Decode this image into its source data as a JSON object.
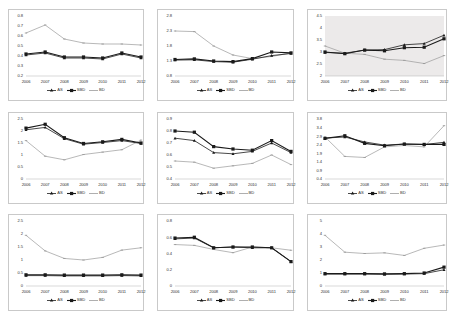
{
  "figure": {
    "layout": "3x3 grid of line charts",
    "panel_count": 9
  },
  "series_names": [
    "AS",
    "SBD",
    "BD"
  ],
  "legend": {
    "as": "AS",
    "sbd": "SBD",
    "bd": "BD",
    "position": "bottom-center"
  },
  "categories": [
    "2006",
    "2007",
    "2008",
    "2009",
    "2010",
    "2011",
    "2012"
  ],
  "colors": {
    "line_as": "#1a1a1a",
    "line_sbd": "#1a1a1a",
    "line_bd": "#9a9a9a",
    "axis": "#b0b0b0",
    "text": "#333333",
    "panel_border": "#c9c9c9",
    "shaded_plot_bg": "#eceaea"
  },
  "chart_data": [
    {
      "id": "panel-1",
      "type": "line",
      "title": "",
      "xlabel": "",
      "ylabel": "",
      "categories": [
        "2006",
        "2007",
        "2008",
        "2009",
        "2010",
        "2011",
        "2012"
      ],
      "yticks": [
        "0.8",
        "0.7",
        "0.6",
        "0.5",
        "0.4",
        "0.3",
        "0.2"
      ],
      "ylim": [
        0.2,
        0.8
      ],
      "grid": false,
      "series": [
        {
          "name": "AS",
          "values": [
            0.41,
            0.43,
            0.38,
            0.38,
            0.37,
            0.42,
            0.38
          ]
        },
        {
          "name": "SBD",
          "values": [
            0.42,
            0.44,
            0.39,
            0.39,
            0.38,
            0.43,
            0.39
          ]
        },
        {
          "name": "BD",
          "values": [
            0.63,
            0.71,
            0.57,
            0.53,
            0.52,
            0.52,
            0.51
          ]
        }
      ]
    },
    {
      "id": "panel-2",
      "type": "line",
      "title": "",
      "xlabel": "",
      "ylabel": "",
      "categories": [
        "2006",
        "2007",
        "2008",
        "2009",
        "2010",
        "2011",
        "2012"
      ],
      "yticks": [
        "2.8",
        "2.3",
        "1.8",
        "1.3",
        "0.8"
      ],
      "ylim": [
        0.8,
        2.8
      ],
      "grid": false,
      "series": [
        {
          "name": "AS",
          "values": [
            1.33,
            1.34,
            1.28,
            1.26,
            1.36,
            1.48,
            1.55
          ]
        },
        {
          "name": "SBD",
          "values": [
            1.35,
            1.37,
            1.3,
            1.28,
            1.38,
            1.6,
            1.57
          ]
        },
        {
          "name": "BD",
          "values": [
            2.3,
            2.28,
            1.8,
            1.5,
            1.38,
            1.45,
            1.57
          ]
        }
      ]
    },
    {
      "id": "panel-3",
      "type": "line",
      "title": "",
      "xlabel": "",
      "ylabel": "",
      "categories": [
        "2006",
        "2007",
        "2008",
        "2009",
        "2010",
        "2011",
        "2012"
      ],
      "yticks": [
        "4.5",
        "4",
        "3.5",
        "3",
        "2.5",
        "2"
      ],
      "ylim": [
        2.0,
        4.5
      ],
      "grid": false,
      "shaded": true,
      "series": [
        {
          "name": "AS",
          "values": [
            2.98,
            2.95,
            3.08,
            3.1,
            3.3,
            3.35,
            3.7
          ]
        },
        {
          "name": "SBD",
          "values": [
            3.0,
            2.93,
            3.08,
            3.05,
            3.18,
            3.2,
            3.55
          ]
        },
        {
          "name": "BD",
          "values": [
            3.25,
            2.95,
            2.9,
            2.7,
            2.65,
            2.52,
            2.85
          ]
        }
      ]
    },
    {
      "id": "panel-4",
      "type": "line",
      "title": "",
      "xlabel": "",
      "ylabel": "",
      "categories": [
        "2006",
        "2007",
        "2008",
        "2009",
        "2010",
        "2011",
        "2012"
      ],
      "yticks": [
        "2.5",
        "2",
        "1.5",
        "1",
        "0.5",
        "0"
      ],
      "ylim": [
        0,
        2.5
      ],
      "grid": false,
      "series": [
        {
          "name": "AS",
          "values": [
            2.05,
            2.15,
            1.68,
            1.45,
            1.52,
            1.6,
            1.48
          ]
        },
        {
          "name": "SBD",
          "values": [
            2.12,
            2.28,
            1.72,
            1.48,
            1.55,
            1.65,
            1.5
          ]
        },
        {
          "name": "BD",
          "values": [
            1.6,
            0.95,
            0.8,
            1.02,
            1.12,
            1.22,
            1.62
          ]
        }
      ]
    },
    {
      "id": "panel-5",
      "type": "line",
      "title": "",
      "xlabel": "",
      "ylabel": "",
      "categories": [
        "2006",
        "2007",
        "2008",
        "2009",
        "2010",
        "2011",
        "2012"
      ],
      "yticks": [
        "0.9",
        "0.8",
        "0.7",
        "0.6",
        "0.5",
        "0.4"
      ],
      "ylim": [
        0.4,
        0.9
      ],
      "grid": false,
      "series": [
        {
          "name": "AS",
          "values": [
            0.74,
            0.72,
            0.62,
            0.61,
            0.63,
            0.7,
            0.62
          ]
        },
        {
          "name": "SBD",
          "values": [
            0.8,
            0.79,
            0.67,
            0.65,
            0.64,
            0.72,
            0.63
          ]
        },
        {
          "name": "BD",
          "values": [
            0.55,
            0.54,
            0.49,
            0.51,
            0.53,
            0.6,
            0.52
          ]
        }
      ]
    },
    {
      "id": "panel-6",
      "type": "line",
      "title": "",
      "xlabel": "",
      "ylabel": "",
      "categories": [
        "2006",
        "2007",
        "2008",
        "2009",
        "2010",
        "2011",
        "2012"
      ],
      "yticks": [
        "3.8",
        "3.4",
        "2.9",
        "2.4",
        "1.9",
        "1.4",
        "0.9",
        "0.4"
      ],
      "ylim": [
        0.4,
        3.8
      ],
      "grid": false,
      "series": [
        {
          "name": "AS",
          "values": [
            2.72,
            2.78,
            2.5,
            2.32,
            2.38,
            2.35,
            2.48
          ]
        },
        {
          "name": "SBD",
          "values": [
            2.7,
            2.85,
            2.42,
            2.28,
            2.38,
            2.36,
            2.36
          ]
        },
        {
          "name": "BD",
          "values": [
            2.78,
            1.68,
            1.62,
            2.22,
            2.3,
            2.22,
            3.42
          ]
        }
      ]
    },
    {
      "id": "panel-7",
      "type": "line",
      "title": "",
      "xlabel": "",
      "ylabel": "",
      "categories": [
        "2006",
        "2007",
        "2008",
        "2009",
        "2010",
        "2011",
        "2012"
      ],
      "yticks": [
        "2.5",
        "2",
        "1.5",
        "1",
        "0.5",
        "0"
      ],
      "ylim": [
        0,
        2.5
      ],
      "grid": false,
      "series": [
        {
          "name": "AS",
          "values": [
            0.4,
            0.4,
            0.39,
            0.39,
            0.39,
            0.4,
            0.39
          ]
        },
        {
          "name": "SBD",
          "values": [
            0.43,
            0.43,
            0.42,
            0.42,
            0.42,
            0.43,
            0.42
          ]
        },
        {
          "name": "BD",
          "values": [
            1.95,
            1.35,
            1.06,
            1.0,
            1.1,
            1.38,
            1.47
          ]
        }
      ]
    },
    {
      "id": "panel-8",
      "type": "line",
      "title": "",
      "xlabel": "",
      "ylabel": "",
      "categories": [
        "2006",
        "2007",
        "2008",
        "2009",
        "2010",
        "2011",
        "2012"
      ],
      "yticks": [
        "0.8",
        "0.6",
        "0.4",
        "0.2",
        "0"
      ],
      "ylim": [
        0,
        0.8
      ],
      "grid": false,
      "series": [
        {
          "name": "AS",
          "values": [
            0.58,
            0.59,
            0.47,
            0.48,
            0.47,
            0.47,
            0.3
          ]
        },
        {
          "name": "SBD",
          "values": [
            0.59,
            0.6,
            0.47,
            0.48,
            0.48,
            0.47,
            0.3
          ]
        },
        {
          "name": "BD",
          "values": [
            0.51,
            0.5,
            0.45,
            0.41,
            0.48,
            0.47,
            0.44
          ]
        }
      ]
    },
    {
      "id": "panel-9",
      "type": "line",
      "title": "",
      "xlabel": "",
      "ylabel": "",
      "categories": [
        "2006",
        "2007",
        "2008",
        "2009",
        "2010",
        "2011",
        "2012"
      ],
      "yticks": [
        "5",
        "4",
        "3",
        "2",
        "1",
        "0"
      ],
      "ylim": [
        0,
        5
      ],
      "grid": false,
      "series": [
        {
          "name": "AS",
          "values": [
            0.92,
            0.92,
            0.92,
            0.9,
            0.92,
            0.95,
            1.25
          ]
        },
        {
          "name": "SBD",
          "values": [
            0.95,
            0.95,
            0.95,
            0.93,
            0.95,
            1.0,
            1.45
          ]
        },
        {
          "name": "BD",
          "values": [
            3.9,
            2.6,
            2.5,
            2.55,
            2.35,
            2.9,
            3.15
          ]
        }
      ]
    }
  ]
}
